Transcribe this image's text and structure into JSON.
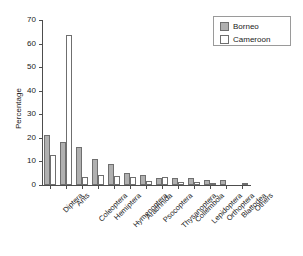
{
  "chart_data": {
    "type": "bar",
    "title": "",
    "xlabel": "",
    "ylabel": "Percentage",
    "ylim": [
      0,
      70
    ],
    "yticks": [
      0,
      10,
      20,
      30,
      40,
      50,
      60,
      70
    ],
    "grid": false,
    "legend_position": "top-right",
    "categories": [
      "Diptera",
      "Ants",
      "Coleoptera",
      "Hemiptera",
      "Hymenoptera",
      "Arachnida",
      "Psocoptera",
      "Thysanoptera",
      "Collembola",
      "Lepidoptera",
      "Orthoptera",
      "Blattodea",
      "Others"
    ],
    "series": [
      {
        "name": "Borneo",
        "color": "#b0b0b0",
        "values": [
          21.3,
          18.2,
          16.3,
          11.0,
          8.9,
          5.1,
          4.1,
          2.9,
          3.1,
          3.1,
          2.3,
          2.0,
          0.0
        ]
      },
      {
        "name": "Cameroon",
        "color": "#ffffff",
        "values": [
          12.9,
          63.7,
          3.5,
          4.1,
          4.0,
          3.5,
          1.9,
          3.6,
          1.2,
          1.4,
          1.0,
          0.0,
          1.0
        ]
      }
    ]
  },
  "legend": {
    "entries": [
      {
        "label": "Borneo",
        "swatch": "borneo"
      },
      {
        "label": "Cameroon",
        "swatch": "cameroon"
      }
    ]
  },
  "axis": {
    "y_label": "Percentage"
  }
}
